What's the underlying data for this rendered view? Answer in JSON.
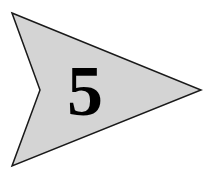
{
  "arrow": {
    "label": "5",
    "fill_color": "#d4d4d4",
    "stroke_color": "#1a1a1a",
    "text_color": "#000000",
    "shape": "arrowhead-pointing-right",
    "points": "12,13 201,90 12,166 40,90"
  }
}
